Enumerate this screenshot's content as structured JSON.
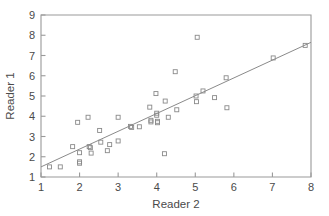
{
  "chart_data": {
    "type": "scatter",
    "title": "",
    "xlabel": "Reader 2",
    "ylabel": "Reader 1",
    "xlim": [
      1,
      8
    ],
    "ylim": [
      1,
      9
    ],
    "xticks": [
      1,
      2,
      3,
      4,
      5,
      6,
      7,
      8
    ],
    "yticks": [
      1,
      2,
      3,
      4,
      5,
      6,
      7,
      8,
      9
    ],
    "xtick_labels": [
      "1",
      "2",
      "3",
      "4",
      "5",
      "6",
      "7",
      "8"
    ],
    "ytick_labels": [
      "1",
      "2",
      "3",
      "4",
      "5",
      "6",
      "7",
      "8",
      "9"
    ],
    "grid": false,
    "legend": null,
    "marker": "open-square",
    "marker_size": 4,
    "marker_color": "#8a8a8a",
    "axis_color": "#9a9a9a",
    "text_color": "#4a4a4a",
    "points": [
      [
        1.22,
        1.5
      ],
      [
        1.5,
        1.5
      ],
      [
        1.82,
        2.5
      ],
      [
        1.95,
        3.7
      ],
      [
        2.0,
        2.2
      ],
      [
        2.0,
        1.75
      ],
      [
        2.0,
        1.68
      ],
      [
        2.22,
        3.95
      ],
      [
        2.25,
        2.5
      ],
      [
        2.28,
        2.45
      ],
      [
        2.3,
        2.18
      ],
      [
        2.52,
        3.3
      ],
      [
        2.55,
        2.72
      ],
      [
        2.72,
        2.3
      ],
      [
        2.78,
        2.6
      ],
      [
        3.0,
        2.78
      ],
      [
        3.0,
        3.95
      ],
      [
        3.32,
        3.5
      ],
      [
        3.35,
        3.45
      ],
      [
        3.55,
        3.48
      ],
      [
        3.82,
        4.45
      ],
      [
        3.85,
        3.8
      ],
      [
        3.85,
        3.72
      ],
      [
        3.98,
        5.12
      ],
      [
        4.0,
        4.15
      ],
      [
        4.0,
        4.05
      ],
      [
        4.02,
        3.75
      ],
      [
        4.02,
        3.68
      ],
      [
        4.2,
        2.15
      ],
      [
        4.22,
        4.75
      ],
      [
        4.3,
        3.95
      ],
      [
        4.48,
        6.2
      ],
      [
        4.52,
        4.32
      ],
      [
        5.02,
        5.0
      ],
      [
        5.03,
        4.72
      ],
      [
        5.05,
        7.9
      ],
      [
        5.2,
        5.25
      ],
      [
        5.5,
        4.92
      ],
      [
        5.8,
        5.9
      ],
      [
        5.82,
        4.42
      ],
      [
        7.02,
        6.88
      ],
      [
        7.85,
        7.5
      ]
    ],
    "fit_line": {
      "x": [
        1.0,
        8.0
      ],
      "y": [
        1.5,
        7.65
      ],
      "color": "#8a8a8a"
    }
  }
}
